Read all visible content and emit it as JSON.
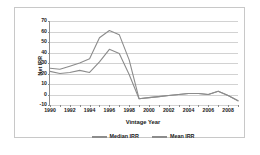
{
  "chart_data": {
    "type": "line",
    "title": "",
    "xlabel": "Vintage Year",
    "ylabel": "Net IRR",
    "xlim": [
      1990,
      2009
    ],
    "ylim": [
      -10,
      70
    ],
    "ytick_values": [
      70,
      60,
      50,
      40,
      30,
      20,
      10,
      0,
      -10
    ],
    "ytick_labels": [
      "70",
      "60",
      "50",
      "40",
      "30",
      "20",
      "10",
      "0",
      "-10"
    ],
    "xtick_values": [
      1990,
      1991,
      1992,
      1993,
      1994,
      1995,
      1996,
      1997,
      1998,
      1999,
      2000,
      2001,
      2002,
      2003,
      2004,
      2005,
      2006,
      2007,
      2008,
      2009
    ],
    "xtick_labels": [
      "1990",
      "",
      "1992",
      "",
      "1994",
      "",
      "1996",
      "",
      "1998",
      "",
      "2000",
      "",
      "2002",
      "",
      "2004",
      "",
      "2006",
      "",
      "2008",
      ""
    ],
    "grid": true,
    "legend_position": "bottom",
    "x": [
      1990,
      1991,
      1992,
      1993,
      1994,
      1995,
      1996,
      1997,
      1998,
      1999,
      2000,
      2001,
      2002,
      2003,
      2004,
      2005,
      2006,
      2007,
      2008,
      2009
    ],
    "series": [
      {
        "name": "Median IRR",
        "color": "#8c8c8c",
        "values": [
          22,
          20,
          21,
          23,
          21,
          31,
          43,
          39,
          19,
          -4,
          -3,
          -2,
          -1,
          0,
          1,
          1,
          0,
          3,
          -1,
          -6
        ]
      },
      {
        "name": "Mean IRR",
        "color": "#8c8c8c",
        "values": [
          25,
          24,
          27,
          30,
          34,
          54,
          61,
          57,
          33,
          -4,
          -3,
          -2,
          -1,
          0,
          1,
          1,
          0,
          3,
          -1,
          -6
        ]
      }
    ]
  },
  "legend": {
    "entries": [
      {
        "label": "Median IRR"
      },
      {
        "label": "Mean IRR"
      }
    ]
  },
  "colors": {
    "line": "#8c8c8c",
    "grid": "#d2d2d2",
    "axis": "#8a8a8a",
    "border": "#c8c8c8",
    "text": "#1a1a1a",
    "background": "#ffffff"
  }
}
